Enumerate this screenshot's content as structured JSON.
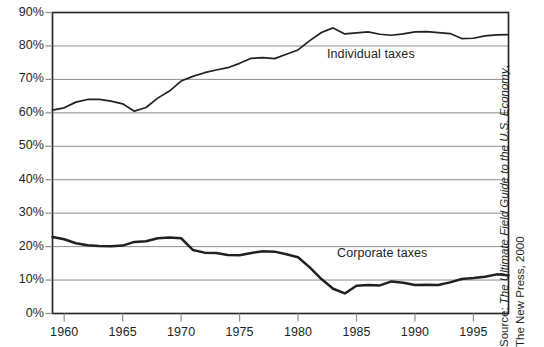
{
  "chart_data": {
    "type": "line",
    "title": "",
    "xlabel": "",
    "ylabel": "",
    "xlim": [
      1959,
      1998
    ],
    "ylim": [
      0,
      90
    ],
    "grid": true,
    "grid_axis": "y",
    "legend_position": "inline-annotation",
    "y_tick_labels": [
      "90%",
      "80%",
      "70%",
      "60%",
      "50%",
      "40%",
      "30%",
      "20%",
      "10%",
      "0%"
    ],
    "y_ticks": [
      90,
      80,
      70,
      60,
      50,
      40,
      30,
      20,
      10,
      0
    ],
    "x_tick_labels": [
      "1960",
      "1965",
      "1970",
      "1975",
      "1980",
      "1985",
      "1990",
      "1995"
    ],
    "x_ticks": [
      1960,
      1965,
      1970,
      1975,
      1980,
      1985,
      1990,
      1995
    ],
    "x": [
      1959,
      1960,
      1961,
      1962,
      1963,
      1964,
      1965,
      1966,
      1967,
      1968,
      1969,
      1970,
      1971,
      1972,
      1973,
      1974,
      1975,
      1976,
      1977,
      1978,
      1979,
      1980,
      1981,
      1982,
      1983,
      1984,
      1985,
      1986,
      1987,
      1988,
      1989,
      1990,
      1991,
      1992,
      1993,
      1994,
      1995,
      1996,
      1997,
      1998
    ],
    "series": [
      {
        "name": "Individual taxes",
        "color": "#231f20",
        "values": [
          60.8,
          61.5,
          63.2,
          64.0,
          64.0,
          63.5,
          62.7,
          60.5,
          61.6,
          64.4,
          66.5,
          69.5,
          70.9,
          72.0,
          72.8,
          73.5,
          74.8,
          76.3,
          76.5,
          76.2,
          77.5,
          78.8,
          81.6,
          84.0,
          85.4,
          83.6,
          83.9,
          84.2,
          83.5,
          83.2,
          83.6,
          84.2,
          84.3,
          84.0,
          83.7,
          82.2,
          82.3,
          83.0,
          83.3,
          83.4
        ]
      },
      {
        "name": "Corporate taxes",
        "color": "#231f20",
        "values": [
          22.9,
          22.2,
          21.0,
          20.4,
          20.2,
          20.1,
          20.3,
          21.4,
          21.6,
          22.5,
          22.7,
          22.5,
          19.0,
          18.2,
          18.1,
          17.5,
          17.4,
          18.1,
          18.6,
          18.5,
          17.7,
          16.8,
          13.8,
          10.3,
          7.4,
          6.0,
          8.3,
          8.5,
          8.4,
          9.6,
          9.2,
          8.5,
          8.6,
          8.5,
          9.3,
          10.3,
          10.6,
          11.0,
          11.7,
          11.4
        ]
      }
    ]
  },
  "annotations": {
    "individual_label": "Individual taxes",
    "corporate_label": "Corporate taxes"
  },
  "source": {
    "prefix": "Source: ",
    "title_italic": "The Ultimate Field Guide to the U.S. Economy",
    "suffix": ",",
    "line2": "The New Press, 2000"
  }
}
